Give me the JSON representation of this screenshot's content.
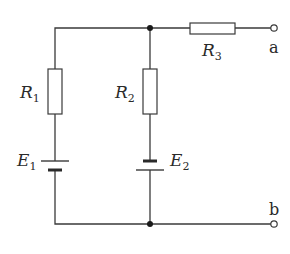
{
  "diagram": {
    "type": "circuit",
    "components": {
      "R1": {
        "symbol": "R",
        "sub": "1",
        "kind": "resistor"
      },
      "R2": {
        "symbol": "R",
        "sub": "2",
        "kind": "resistor"
      },
      "R3": {
        "symbol": "R",
        "sub": "3",
        "kind": "resistor"
      },
      "E1": {
        "symbol": "E",
        "sub": "1",
        "kind": "battery",
        "orientation": "long-plate-top"
      },
      "E2": {
        "symbol": "E",
        "sub": "2",
        "kind": "battery",
        "orientation": "short-plate-top"
      }
    },
    "terminals": {
      "a": {
        "label": "a"
      },
      "b": {
        "label": "b"
      }
    },
    "colors": {
      "line": "#3a3a3a",
      "node": "#1a1a1a",
      "background": "#ffffff"
    }
  }
}
